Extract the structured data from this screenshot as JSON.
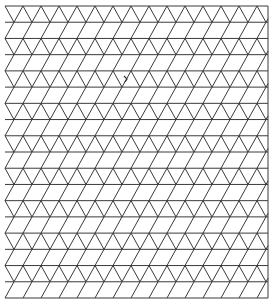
{
  "diagram": {
    "type": "triangular-isometric-grid",
    "width": 277,
    "height": 306,
    "grid": {
      "left": 5,
      "right": 268,
      "top": 6,
      "bottom": 298,
      "rows": 18,
      "vertex_spacing_x": 18,
      "odd_row_offset": 9,
      "line_color": "#3a3a3a",
      "background_color": "#ffffff",
      "right_border": true
    },
    "annotations": [
      {
        "kind": "small-pen-mark",
        "x": 126,
        "y": 79
      }
    ]
  }
}
